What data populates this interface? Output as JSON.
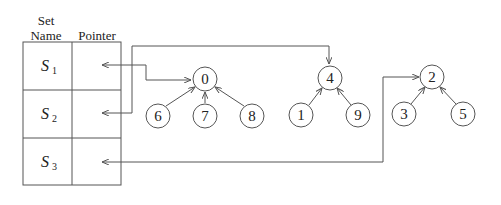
{
  "table": {
    "headers": {
      "set_name": "Set\nName",
      "set_name_line1": "Set",
      "set_name_line2": "Name",
      "pointer": "Pointer"
    },
    "rows": [
      {
        "set": "S",
        "sub": "1",
        "points_to": "0"
      },
      {
        "set": "S",
        "sub": "2",
        "points_to": "4"
      },
      {
        "set": "S",
        "sub": "3",
        "points_to": "2"
      }
    ]
  },
  "trees": [
    {
      "root": "0",
      "children": [
        "6",
        "7",
        "8"
      ]
    },
    {
      "root": "4",
      "children": [
        "1",
        "9"
      ]
    },
    {
      "root": "2",
      "children": [
        "3",
        "5"
      ]
    }
  ],
  "colors": {
    "line": "#555555",
    "text": "#222222",
    "background": "#ffffff"
  }
}
